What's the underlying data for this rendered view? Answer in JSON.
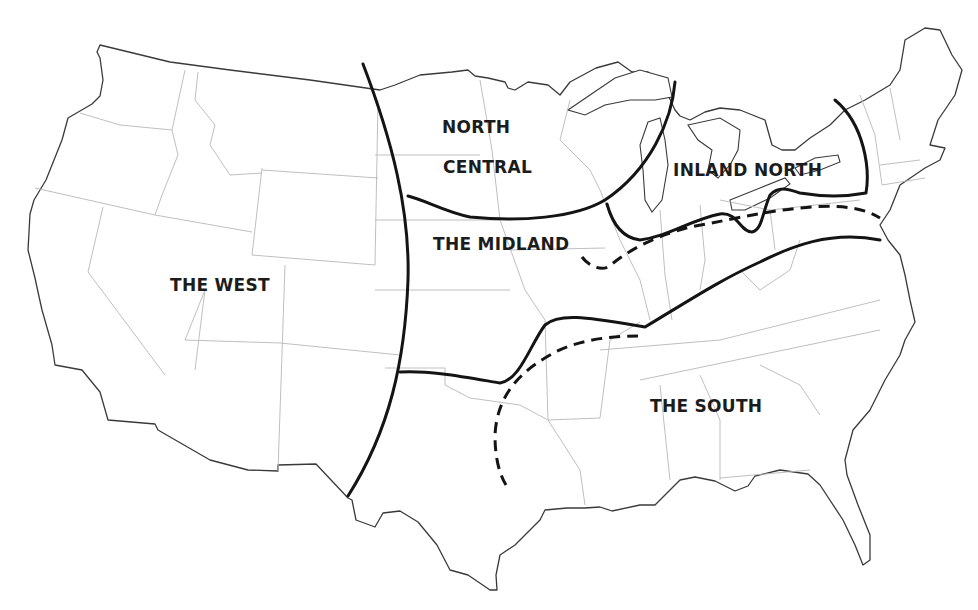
{
  "map": {
    "subject": "American English dialect regions",
    "colors": {
      "background": "#ffffff",
      "coastline": "#3a3a3a",
      "state_border": "#b8b8b8",
      "isogloss": "#141414"
    },
    "regions": [
      {
        "id": "north-central-1",
        "label": "NORTH",
        "x": 442,
        "y": 117
      },
      {
        "id": "north-central-2",
        "label": "CENTRAL",
        "x": 443,
        "y": 157
      },
      {
        "id": "inland-north",
        "label": "INLAND NORTH",
        "x": 673,
        "y": 160
      },
      {
        "id": "the-midland",
        "label": "THE MIDLAND",
        "x": 433,
        "y": 234
      },
      {
        "id": "the-west",
        "label": "THE WEST",
        "x": 170,
        "y": 275
      },
      {
        "id": "the-south",
        "label": "THE SOUTH",
        "x": 650,
        "y": 396
      }
    ],
    "boundaries": [
      {
        "id": "west-boundary",
        "style": "solid"
      },
      {
        "id": "north-central-arc",
        "style": "solid"
      },
      {
        "id": "north-central-midland",
        "style": "solid"
      },
      {
        "id": "inland-north-south",
        "style": "solid"
      },
      {
        "id": "inland-north-east",
        "style": "solid"
      },
      {
        "id": "midland-south",
        "style": "solid"
      },
      {
        "id": "midland-inland-north-dashed",
        "style": "dashed"
      },
      {
        "id": "midland-south-dashed",
        "style": "dashed"
      }
    ]
  }
}
